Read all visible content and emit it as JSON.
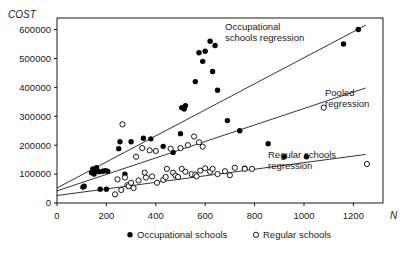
{
  "chart_data": {
    "type": "scatter",
    "title": "",
    "xlabel": "N",
    "ylabel": "COST",
    "xlim": [
      0,
      1320
    ],
    "ylim": [
      0,
      640000
    ],
    "grid": false,
    "legend_position": "bottom",
    "x_ticks": [
      0,
      200,
      400,
      600,
      800,
      1000,
      1200
    ],
    "x_tick_labels": [
      "0",
      "200",
      "400",
      "600",
      "800",
      "1000",
      "1200"
    ],
    "y_ticks": [
      0,
      100000,
      200000,
      300000,
      400000,
      500000,
      600000
    ],
    "y_tick_labels": [
      "0",
      "100000",
      "200000",
      "300000",
      "400000",
      "500000",
      "600000"
    ],
    "series": [
      {
        "name": "Occupational schools",
        "marker": "filled-circle",
        "color": "#000000",
        "points": [
          [
            105,
            55000
          ],
          [
            110,
            58000
          ],
          [
            140,
            105000
          ],
          [
            145,
            118000
          ],
          [
            150,
            100000
          ],
          [
            155,
            112000
          ],
          [
            160,
            122000
          ],
          [
            170,
            108000
          ],
          [
            175,
            48000
          ],
          [
            185,
            110000
          ],
          [
            195,
            112000
          ],
          [
            200,
            48000
          ],
          [
            205,
            110000
          ],
          [
            250,
            188000
          ],
          [
            255,
            212000
          ],
          [
            275,
            100000
          ],
          [
            300,
            212000
          ],
          [
            350,
            224000
          ],
          [
            380,
            222000
          ],
          [
            430,
            196000
          ],
          [
            470,
            175000
          ],
          [
            500,
            240000
          ],
          [
            505,
            330000
          ],
          [
            515,
            325000
          ],
          [
            520,
            337000
          ],
          [
            560,
            420000
          ],
          [
            575,
            520000
          ],
          [
            590,
            490000
          ],
          [
            600,
            525000
          ],
          [
            620,
            560000
          ],
          [
            630,
            455000
          ],
          [
            640,
            545000
          ],
          [
            650,
            390000
          ],
          [
            690,
            285000
          ],
          [
            740,
            250000
          ],
          [
            760,
            120000
          ],
          [
            855,
            205000
          ],
          [
            920,
            160000
          ],
          [
            1010,
            160000
          ],
          [
            1160,
            550000
          ],
          [
            1220,
            600000
          ]
        ]
      },
      {
        "name": "Regular schools",
        "marker": "open-circle",
        "color": "#000000",
        "points": [
          [
            235,
            30000
          ],
          [
            245,
            82000
          ],
          [
            260,
            45000
          ],
          [
            265,
            272000
          ],
          [
            275,
            88000
          ],
          [
            285,
            62000
          ],
          [
            290,
            58000
          ],
          [
            300,
            70000
          ],
          [
            310,
            52000
          ],
          [
            320,
            160000
          ],
          [
            330,
            78000
          ],
          [
            345,
            190000
          ],
          [
            355,
            105000
          ],
          [
            360,
            88000
          ],
          [
            375,
            182000
          ],
          [
            385,
            92000
          ],
          [
            400,
            180000
          ],
          [
            405,
            70000
          ],
          [
            430,
            80000
          ],
          [
            440,
            90000
          ],
          [
            445,
            118000
          ],
          [
            460,
            188000
          ],
          [
            470,
            105000
          ],
          [
            480,
            95000
          ],
          [
            490,
            90000
          ],
          [
            500,
            190000
          ],
          [
            505,
            118000
          ],
          [
            520,
            108000
          ],
          [
            530,
            200000
          ],
          [
            545,
            100000
          ],
          [
            555,
            230000
          ],
          [
            560,
            98000
          ],
          [
            565,
            92000
          ],
          [
            575,
            210000
          ],
          [
            580,
            112000
          ],
          [
            590,
            195000
          ],
          [
            600,
            120000
          ],
          [
            620,
            108000
          ],
          [
            630,
            118000
          ],
          [
            650,
            100000
          ],
          [
            680,
            110000
          ],
          [
            700,
            96000
          ],
          [
            720,
            122000
          ],
          [
            760,
            118000
          ],
          [
            790,
            118000
          ],
          [
            1080,
            330000
          ],
          [
            1255,
            135000
          ]
        ]
      }
    ],
    "regressions": [
      {
        "label": "Occupational schools regression",
        "x0": 0,
        "y0": 52000,
        "x1": 1250,
        "y1": 615000
      },
      {
        "label": "Pooled regression",
        "x0": 0,
        "y0": 42000,
        "x1": 1250,
        "y1": 398000
      },
      {
        "label": "Regular schools regression",
        "x0": 0,
        "y0": 26000,
        "x1": 1250,
        "y1": 168000
      }
    ],
    "annotations": [
      {
        "name": "occupational-regression-label",
        "line1": "Occupational",
        "line2": "schools regression",
        "x": 225,
        "y": 30
      },
      {
        "name": "pooled-regression-label",
        "line1": "Pooled",
        "line2": "regression",
        "x": 325,
        "y": 96
      },
      {
        "name": "regular-regression-label",
        "line1": "Regular schools",
        "line2": "regression",
        "x": 268,
        "y": 158
      }
    ],
    "legend": [
      {
        "marker": "filled-circle",
        "label": "Occupational schools"
      },
      {
        "marker": "open-circle",
        "label": "Regular schools"
      }
    ]
  }
}
